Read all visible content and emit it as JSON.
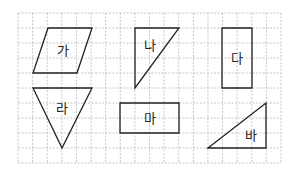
{
  "grid": {
    "x0": 18,
    "y0": 13,
    "cols": 18,
    "rows": 10,
    "cell_w": 14.61,
    "cell_h": 15,
    "line_color": "#b8b8b8"
  },
  "stroke_color": "#222222",
  "shapes": [
    {
      "id": "ga",
      "label": "가",
      "type": "parallelogram",
      "points": "48,28 92,28 77,73 33,73",
      "label_pos": [
        63,
        50
      ]
    },
    {
      "id": "na",
      "label": "나",
      "type": "right-triangle",
      "points": "135,28 179,28 135,88",
      "label_pos": [
        150,
        45
      ]
    },
    {
      "id": "da",
      "label": "다",
      "type": "rectangle",
      "points": "222,28 252,28 252,88 222,88",
      "label_pos": [
        237,
        58
      ]
    },
    {
      "id": "ra",
      "label": "라",
      "type": "triangle",
      "points": "33,88 92,88 62,148",
      "label_pos": [
        62,
        108
      ]
    },
    {
      "id": "ma",
      "label": "마",
      "type": "rectangle",
      "points": "120,103 179,103 179,133 120,133",
      "label_pos": [
        150,
        118
      ]
    },
    {
      "id": "ba",
      "label": "바",
      "type": "right-triangle",
      "points": "208,148 266,103 266,148",
      "label_pos": [
        251,
        135
      ]
    }
  ]
}
